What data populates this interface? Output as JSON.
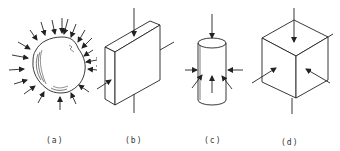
{
  "figure": {
    "panels": [
      {
        "id": "a",
        "label": "(a)",
        "subject": "irregular rock particle under uniform all-around compression",
        "arrows": 20
      },
      {
        "id": "b",
        "label": "(b)",
        "subject": "rectangular slab compressed on two axes",
        "arrows": 2
      },
      {
        "id": "c",
        "label": "(c)",
        "subject": "cylinder under axial and lateral compression",
        "arrows": 5
      },
      {
        "id": "d",
        "label": "(d)",
        "subject": "cube under triaxial compression",
        "arrows": 3
      }
    ],
    "stroke_color": "#222222"
  }
}
